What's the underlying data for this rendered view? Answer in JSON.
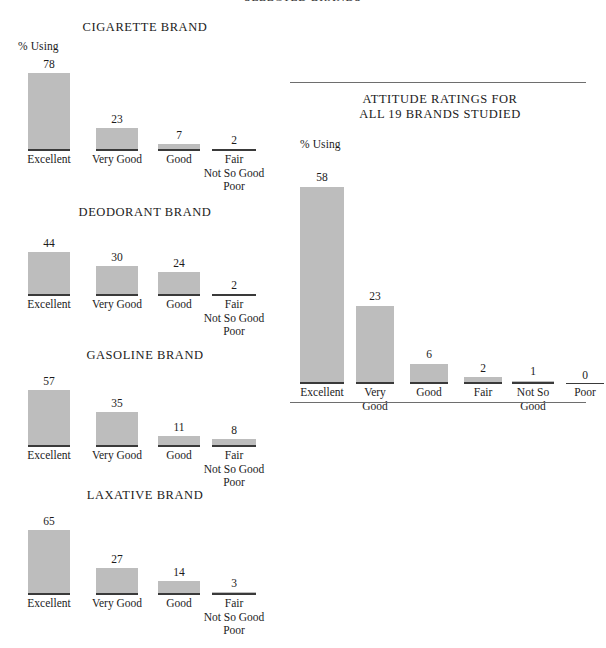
{
  "document": {
    "top_heading": "SELECTED BRANDS"
  },
  "axis": {
    "pct_using_label": "% Using"
  },
  "chart_data": [
    {
      "type": "bar",
      "title": "CIGARETTE BRAND",
      "xlabel": "",
      "ylabel": "% Using",
      "ylim": [
        0,
        78
      ],
      "grid": false,
      "legend": "none",
      "categories": [
        "Excellent",
        "Very Good",
        "Good",
        "Fair\nNot So Good\nPoor"
      ],
      "category_lines": [
        [
          "Excellent"
        ],
        [
          "Very Good"
        ],
        [
          "Good"
        ],
        [
          "Fair",
          "Not So Good",
          "Poor"
        ]
      ],
      "values": [
        78,
        23,
        7,
        2
      ]
    },
    {
      "type": "bar",
      "title": "DEODORANT BRAND",
      "xlabel": "",
      "ylabel": "% Using",
      "ylim": [
        0,
        78
      ],
      "grid": false,
      "legend": "none",
      "categories": [
        "Excellent",
        "Very Good",
        "Good",
        "Fair\nNot So Good\nPoor"
      ],
      "category_lines": [
        [
          "Excellent"
        ],
        [
          "Very Good"
        ],
        [
          "Good"
        ],
        [
          "Fair",
          "Not So Good",
          "Poor"
        ]
      ],
      "values": [
        44,
        30,
        24,
        2
      ]
    },
    {
      "type": "bar",
      "title": "GASOLINE BRAND",
      "xlabel": "",
      "ylabel": "% Using",
      "ylim": [
        0,
        78
      ],
      "grid": false,
      "legend": "none",
      "categories": [
        "Excellent",
        "Very Good",
        "Good",
        "Fair\nNot So Good\nPoor"
      ],
      "category_lines": [
        [
          "Excellent"
        ],
        [
          "Very Good"
        ],
        [
          "Good"
        ],
        [
          "Fair",
          "Not So Good",
          "Poor"
        ]
      ],
      "values": [
        57,
        35,
        11,
        8
      ]
    },
    {
      "type": "bar",
      "title": "LAXATIVE BRAND",
      "xlabel": "",
      "ylabel": "% Using",
      "ylim": [
        0,
        78
      ],
      "grid": false,
      "legend": "none",
      "categories": [
        "Excellent",
        "Very Good",
        "Good",
        "Fair\nNot So Good\nPoor"
      ],
      "category_lines": [
        [
          "Excellent"
        ],
        [
          "Very Good"
        ],
        [
          "Good"
        ],
        [
          "Fair",
          "Not So Good",
          "Poor"
        ]
      ],
      "values": [
        65,
        27,
        14,
        3
      ]
    },
    {
      "type": "bar",
      "title": "ATTITUDE RATINGS FOR\nALL 19 BRANDS STUDIED",
      "title_lines": [
        "ATTITUDE RATINGS FOR",
        "ALL 19 BRANDS STUDIED"
      ],
      "xlabel": "",
      "ylabel": "% Using",
      "ylim": [
        0,
        58
      ],
      "grid": false,
      "legend": "none",
      "categories": [
        "Excellent",
        "Very Good",
        "Good",
        "Fair",
        "Not So Good",
        "Poor"
      ],
      "category_lines": [
        [
          "Excellent"
        ],
        [
          "Very",
          "Good"
        ],
        [
          "Good"
        ],
        [
          "Fair"
        ],
        [
          "Not So",
          "Good"
        ],
        [
          "Poor"
        ]
      ],
      "values": [
        58,
        23,
        6,
        2,
        1,
        0
      ]
    }
  ],
  "colors": {
    "bar_fill": "#bdbdbd",
    "baseline": "#3a3a3a",
    "rule": "#6e6e6e",
    "text": "#1b1b1b",
    "background": "#ffffff"
  }
}
